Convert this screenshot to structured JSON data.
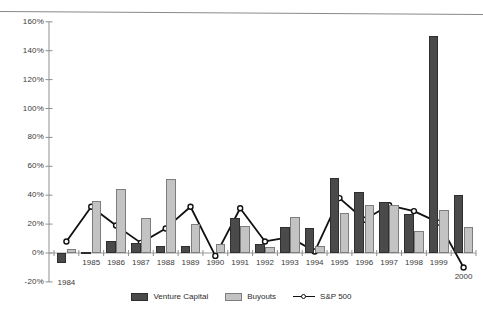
{
  "legend": {
    "items": [
      {
        "label": "Venture Capital",
        "key": "vc",
        "color": "#4a4a4a"
      },
      {
        "label": "Buyouts",
        "key": "bo",
        "color": "#c3c3c3"
      },
      {
        "label": "S&P 500",
        "key": "sp",
        "color": "#111111"
      }
    ]
  },
  "axis": {
    "y_ticks": [
      "160%",
      "140%",
      "120%",
      "100%",
      "80%",
      "60%",
      "40%",
      "20%",
      "0%",
      "-20%"
    ],
    "y_min": -20,
    "y_max": 160,
    "y_step": 20,
    "x_ticks": [
      "1984",
      "1985",
      "1986",
      "1987",
      "1988",
      "1989",
      "1990",
      "1991",
      "1992",
      "1993",
      "1994",
      "1995",
      "1996",
      "1997",
      "1998",
      "1999",
      "2000"
    ]
  },
  "chart_data": {
    "type": "bar",
    "title": "",
    "subtitle": "",
    "xlabel": "",
    "ylabel": "",
    "ylim": [
      -20,
      160
    ],
    "yticks": [
      -20,
      0,
      20,
      40,
      60,
      80,
      100,
      120,
      140,
      160
    ],
    "ytick_labels": [
      "-20%",
      "0%",
      "20%",
      "40%",
      "60%",
      "80%",
      "100%",
      "120%",
      "140%",
      "160%"
    ],
    "grid": false,
    "legend_position": "bottom-center",
    "categories": [
      "1984",
      "1985",
      "1986",
      "1987",
      "1988",
      "1989",
      "1990",
      "1991",
      "1992",
      "1993",
      "1994",
      "1995",
      "1996",
      "1997",
      "1998",
      "1999",
      "2000"
    ],
    "series": [
      {
        "name": "Venture Capital",
        "type": "bar",
        "color": "#4a4a4a",
        "values": [
          -7,
          1,
          8,
          7,
          5,
          5,
          0,
          24,
          6,
          18,
          17,
          52,
          42,
          35,
          27,
          150,
          40
        ]
      },
      {
        "name": "Buyouts",
        "type": "bar",
        "color": "#c3c3c3",
        "values": [
          3,
          36,
          44,
          24,
          51,
          20,
          6,
          19,
          4,
          25,
          5,
          28,
          33,
          33,
          15,
          30,
          18
        ]
      },
      {
        "name": "S&P 500",
        "type": "line",
        "color": "#111111",
        "marker": "open-circle",
        "values": [
          8,
          32,
          19,
          7,
          17,
          32,
          -2,
          31,
          8,
          11,
          1,
          38,
          23,
          33,
          29,
          21,
          -10
        ]
      }
    ]
  }
}
